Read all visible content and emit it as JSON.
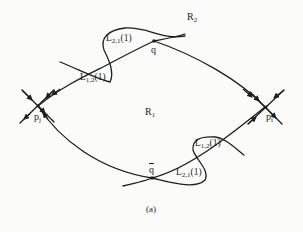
{
  "figure": {
    "caption": "(a)",
    "regions": {
      "upper": {
        "letter": "R",
        "sub": "2"
      },
      "lower": {
        "letter": "R",
        "sub": "1"
      }
    },
    "nodes": {
      "p_j": {
        "letter": "p",
        "sub": "j"
      },
      "p_i": {
        "letter": "p",
        "sub": "i"
      },
      "q": {
        "letter": "q"
      },
      "q_bar": {
        "letter": "q"
      }
    },
    "loops": {
      "top_L21": {
        "letter": "L",
        "sub": "2,1",
        "arg": "(1)"
      },
      "top_L12": {
        "letter": "L",
        "sub": "1,2",
        "arg": "(1)"
      },
      "bottom_L12": {
        "letter": "L",
        "sub": "1,2",
        "arg": "(1)"
      },
      "bottom_L21": {
        "letter": "L",
        "sub": "2,1",
        "arg": "(1)"
      }
    },
    "colors": {
      "ink": "#1e1e1e",
      "paper": "#fbfbf9"
    }
  }
}
